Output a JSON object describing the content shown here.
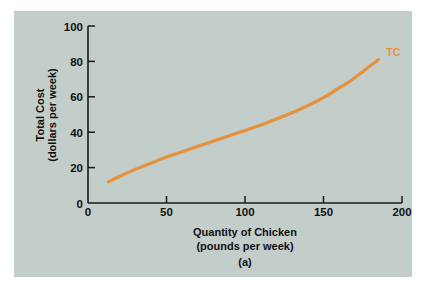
{
  "figure": {
    "caption": "(a)",
    "panel_color": "#c3cdca",
    "background_color": "#ffffff"
  },
  "chart_data": {
    "type": "line",
    "title": "",
    "subtitle": "",
    "xlabel": "Quantity of Chicken",
    "xlabel_units": "(pounds per week)",
    "ylabel": "Total Cost",
    "ylabel_units": "(dollars per week)",
    "xlim": [
      0,
      200
    ],
    "ylim": [
      0,
      100
    ],
    "xticks": [
      0,
      50,
      100,
      150,
      200
    ],
    "xtick_labels": [
      "0",
      "50",
      "100",
      "150",
      "200"
    ],
    "yticks": [
      0,
      20,
      40,
      60,
      80,
      100
    ],
    "ytick_labels": [
      "0",
      "20",
      "40",
      "60",
      "80",
      "100"
    ],
    "grid": false,
    "legend_position": "inline-right-end",
    "series": [
      {
        "name": "TC",
        "label": "TC",
        "color": "#e8903a",
        "x": [
          13,
          20,
          30,
          40,
          50,
          60,
          70,
          80,
          90,
          100,
          110,
          120,
          130,
          140,
          150,
          160,
          168,
          174,
          179,
          182,
          184,
          185
        ],
        "y": [
          12,
          15,
          19,
          22.5,
          26,
          29,
          32,
          35,
          38,
          41,
          44,
          47.5,
          51,
          55,
          59.5,
          65,
          69.5,
          73.5,
          77,
          79,
          80.3,
          81
        ]
      }
    ],
    "annotations": [
      {
        "text": "TC",
        "x": 190,
        "y": 83,
        "color": "#e8903a"
      }
    ]
  }
}
